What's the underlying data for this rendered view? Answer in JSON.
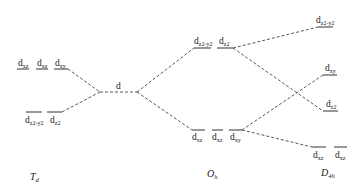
{
  "diagram": {
    "groups": [
      {
        "id": "Td",
        "main": "T",
        "sub": "d"
      },
      {
        "id": "free",
        "main": "",
        "sub": ""
      },
      {
        "id": "Oh",
        "main": "O",
        "sub": "h"
      },
      {
        "id": "D4h",
        "main": "D",
        "sub": "4h"
      }
    ],
    "levels": {
      "td_upper": [
        {
          "main": "d",
          "sub": "xz"
        },
        {
          "main": "d",
          "sub": "xz"
        },
        {
          "main": "d",
          "sub": "xy"
        }
      ],
      "td_lower": [
        {
          "main": "d",
          "sub": "z2-y2"
        },
        {
          "main": "d",
          "sub": "z2"
        }
      ],
      "free": [
        {
          "main": "d",
          "sub": ""
        }
      ],
      "oh_upper": [
        {
          "main": "d",
          "sub": "z2-y2"
        },
        {
          "main": "d",
          "sub": "z2"
        }
      ],
      "oh_lower": [
        {
          "main": "d",
          "sub": "xz"
        },
        {
          "main": "d",
          "sub": "xz"
        },
        {
          "main": "d",
          "sub": "xy"
        }
      ],
      "d4h_top": [
        {
          "main": "d",
          "sub": "z2-y2"
        }
      ],
      "d4h_mid1": [
        {
          "main": "d",
          "sub": "xy"
        }
      ],
      "d4h_mid2": [
        {
          "main": "d",
          "sub": "z2"
        }
      ],
      "d4h_bottom": [
        {
          "main": "d",
          "sub": "xz"
        },
        {
          "main": "d",
          "sub": "xz"
        }
      ]
    }
  }
}
